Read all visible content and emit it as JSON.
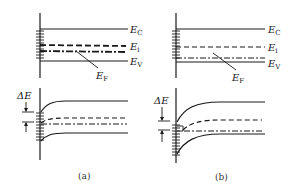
{
  "figure": {
    "panels": [
      {
        "id": "a",
        "caption": "(a)",
        "top": {
          "labels": {
            "ec": "E",
            "ec_sub": "C",
            "ei": "E",
            "ei_sub": "i",
            "ev": "E",
            "ev_sub": "V",
            "ef": "E",
            "ef_sub": "F"
          }
        },
        "bottom": {
          "delta_label": "ΔE"
        }
      },
      {
        "id": "b",
        "caption": "(b)",
        "top": {
          "labels": {
            "ec": "E",
            "ec_sub": "C",
            "ei": "E",
            "ei_sub": "i",
            "ev": "E",
            "ev_sub": "V",
            "ef": "E",
            "ef_sub": "F"
          }
        },
        "bottom": {
          "delta_label": "ΔE"
        }
      }
    ],
    "colors": {
      "line": "#1a1a1a",
      "background": "#ffffff"
    }
  }
}
